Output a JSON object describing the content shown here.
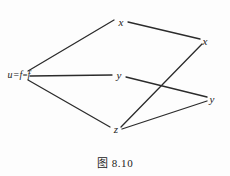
{
  "figure": {
    "caption": "图 8.10",
    "background_color": "#fdfdfd",
    "edge_color": "#2b2b2b",
    "label_color": "#232323"
  },
  "nodes": [
    {
      "id": "root",
      "label": "u=f",
      "label_plain": "u=f",
      "x": 19,
      "y": 75,
      "name": "node-root-u-equals-f"
    },
    {
      "id": "x_top",
      "label": "x",
      "label_plain": "x",
      "x": 121,
      "y": 22,
      "name": "node-x-top"
    },
    {
      "id": "y_mid",
      "label": "y",
      "label_plain": "y",
      "x": 119,
      "y": 75,
      "name": "node-y-middle"
    },
    {
      "id": "z_bot",
      "label": "z",
      "label_plain": "z",
      "x": 116,
      "y": 129,
      "name": "node-z-bottom"
    },
    {
      "id": "x_right",
      "label": "x",
      "label_plain": "x",
      "x": 205,
      "y": 41,
      "name": "node-x-right"
    },
    {
      "id": "y_right",
      "label": "y",
      "label_plain": "y",
      "x": 212,
      "y": 99,
      "name": "node-y-right"
    }
  ],
  "edges": [
    {
      "from": "root",
      "to": "x_top",
      "x1": 28,
      "y1": 71,
      "x2": 114,
      "y2": 20,
      "name": "edge-root-to-x-top"
    },
    {
      "from": "root",
      "to": "y_mid",
      "x1": 30,
      "y1": 76,
      "x2": 112,
      "y2": 75,
      "name": "edge-root-to-y-middle"
    },
    {
      "from": "root",
      "to": "z_bot",
      "x1": 28,
      "y1": 80,
      "x2": 110,
      "y2": 127,
      "name": "edge-root-to-z-bottom"
    },
    {
      "from": "x_top",
      "to": "x_right",
      "x1": 128,
      "y1": 22,
      "x2": 200,
      "y2": 39,
      "name": "edge-x-top-to-x-right"
    },
    {
      "from": "y_mid",
      "to": "y_right",
      "x1": 126,
      "y1": 77,
      "x2": 207,
      "y2": 97,
      "name": "edge-y-middle-to-y-right"
    },
    {
      "from": "z_bot",
      "to": "x_right",
      "x1": 121,
      "y1": 127,
      "x2": 202,
      "y2": 44,
      "name": "edge-z-bottom-to-x-right"
    },
    {
      "from": "z_bot",
      "to": "y_right",
      "x1": 122,
      "y1": 129,
      "x2": 207,
      "y2": 101,
      "name": "edge-z-bottom-to-y-right"
    }
  ]
}
